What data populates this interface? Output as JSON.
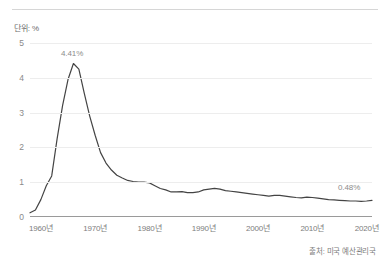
{
  "unit_label": "단위: %",
  "source": "출처: 미국 예산관리국",
  "annotations": {
    "peak": "4.41%",
    "last": "0.48%"
  },
  "chart_data": {
    "type": "line",
    "title": "",
    "subtitle": "",
    "xlabel": "",
    "ylabel": "단위: %",
    "unit": "%",
    "grid": true,
    "legend": false,
    "line_color": "#444444",
    "grid_color": "#ededed",
    "axis_color": "#9a9a9a",
    "xlim": [
      1958,
      2021
    ],
    "ylim": [
      0,
      5
    ],
    "yticks": [
      0,
      1,
      2,
      3,
      4,
      5
    ],
    "ytick_labels": [
      "0",
      "1",
      "2",
      "3",
      "4",
      "5"
    ],
    "xticks": [
      1960,
      1970,
      1980,
      1990,
      2000,
      2010,
      2020
    ],
    "xtick_labels": [
      "1960년",
      "1970년",
      "1980년",
      "1990년",
      "2000년",
      "2010년",
      "2020년"
    ],
    "annotations": [
      {
        "x": 1966,
        "y": 4.41,
        "label": "4.41%"
      },
      {
        "x": 2021,
        "y": 0.48,
        "label": "0.48%"
      }
    ],
    "series": [
      {
        "name": "",
        "x": [
          1958,
          1959,
          1960,
          1961,
          1962,
          1963,
          1964,
          1965,
          1966,
          1967,
          1968,
          1969,
          1970,
          1971,
          1972,
          1973,
          1974,
          1975,
          1976,
          1977,
          1978,
          1979,
          1980,
          1981,
          1982,
          1983,
          1984,
          1985,
          1986,
          1987,
          1988,
          1989,
          1990,
          1991,
          1992,
          1993,
          1994,
          1995,
          1996,
          1997,
          1998,
          1999,
          2000,
          2001,
          2002,
          2003,
          2004,
          2005,
          2006,
          2007,
          2008,
          2009,
          2010,
          2011,
          2012,
          2013,
          2014,
          2015,
          2016,
          2017,
          2018,
          2019,
          2020,
          2021
        ],
        "values": [
          0.12,
          0.2,
          0.5,
          0.9,
          1.18,
          2.25,
          3.2,
          3.95,
          4.41,
          4.25,
          3.55,
          2.9,
          2.35,
          1.85,
          1.55,
          1.35,
          1.2,
          1.12,
          1.05,
          1.02,
          1.0,
          1.0,
          0.98,
          0.9,
          0.82,
          0.78,
          0.72,
          0.72,
          0.73,
          0.7,
          0.7,
          0.72,
          0.78,
          0.8,
          0.82,
          0.8,
          0.76,
          0.74,
          0.72,
          0.7,
          0.68,
          0.66,
          0.64,
          0.62,
          0.6,
          0.62,
          0.62,
          0.6,
          0.58,
          0.56,
          0.55,
          0.57,
          0.56,
          0.54,
          0.52,
          0.5,
          0.49,
          0.48,
          0.47,
          0.46,
          0.46,
          0.45,
          0.46,
          0.48
        ]
      }
    ]
  }
}
